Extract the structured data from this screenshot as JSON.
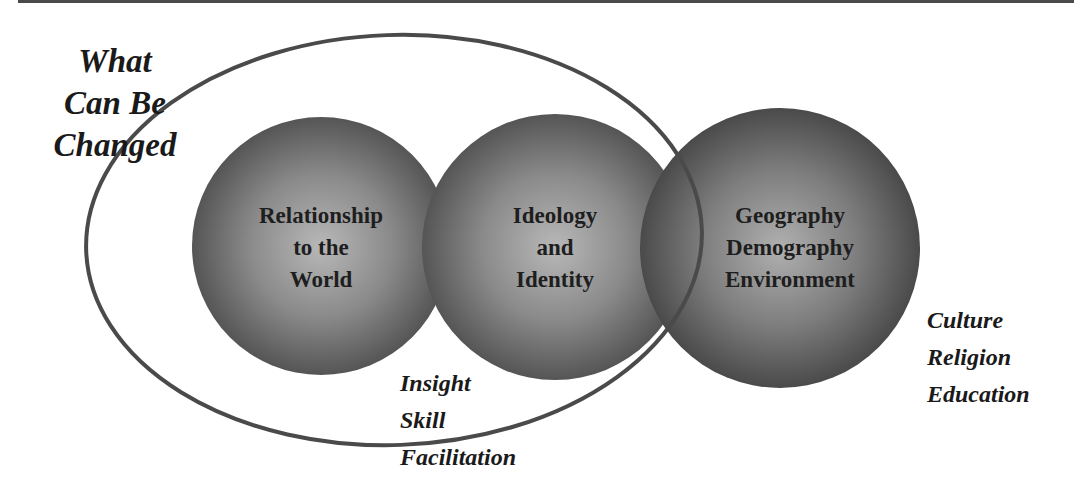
{
  "diagram": {
    "title_lines": [
      "What",
      "Can Be",
      "Changed"
    ],
    "circles": [
      {
        "id": "relationship",
        "lines": [
          "Relationship",
          "to the",
          "World"
        ],
        "cx": 321,
        "cy": 246,
        "r": 129
      },
      {
        "id": "ideology",
        "lines": [
          "Ideology",
          "and",
          "Identity"
        ],
        "cx": 555,
        "cy": 247,
        "r": 133
      },
      {
        "id": "geography",
        "lines": [
          "Geography",
          "Demography",
          "Environment"
        ],
        "cx": 780,
        "cy": 248,
        "r": 140
      }
    ],
    "changeable_factors": [
      "Insight",
      "Skill",
      "Facilitation"
    ],
    "fixed_factors": [
      "Culture",
      "Religion",
      "Education"
    ],
    "colors": {
      "sphere_center": "#b4b4b4",
      "sphere_edge": "#555555",
      "outline": "#4a4a4a",
      "text": "#1a1a1a"
    }
  }
}
